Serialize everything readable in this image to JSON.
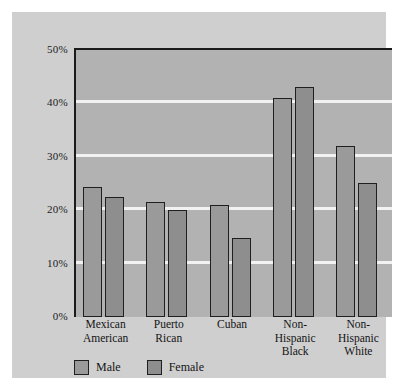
{
  "chart_data": {
    "type": "bar",
    "title": "",
    "xlabel": "",
    "ylabel": "",
    "ylim": [
      0,
      50
    ],
    "grid": true,
    "legend_position": "bottom-left",
    "categories": [
      "Mexican American",
      "Puerto Rican",
      "Cuban",
      "Non-Hispanic Black",
      "Non-Hispanic White"
    ],
    "category_lines": [
      [
        "Mexican",
        "American"
      ],
      [
        "Puerto",
        "Rican"
      ],
      [
        "Cuban"
      ],
      [
        "Non-",
        "Hispanic",
        "Black"
      ],
      [
        "Non-",
        "Hispanic",
        "White"
      ]
    ],
    "ytick_labels": [
      "0%",
      "10%",
      "20%",
      "30%",
      "40%",
      "50%"
    ],
    "ytick_values": [
      0,
      10,
      20,
      30,
      40,
      50
    ],
    "series": [
      {
        "name": "Male",
        "values": [
          24.3,
          21.6,
          20.9,
          41.0,
          32.0
        ]
      },
      {
        "name": "Female",
        "values": [
          22.5,
          20.0,
          14.8,
          43.0,
          25.0
        ]
      }
    ],
    "colors": {
      "male": "#9a9a9a",
      "female": "#8e8e8e",
      "plot_background": "#b2b2b2",
      "card_background": "#cfcfcf",
      "gridline": "#f2f2f2",
      "axis": "#1b1b1b",
      "text": "#141414"
    }
  }
}
